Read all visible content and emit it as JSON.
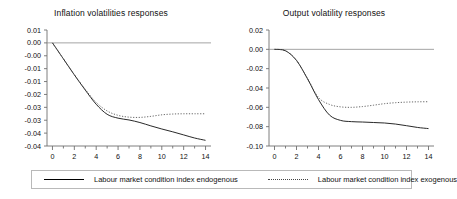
{
  "legend": {
    "entries": [
      {
        "label": "Labour market condition index endogenous",
        "style": "solid",
        "color": "#000000"
      },
      {
        "label": "Labour market condition index exogenous",
        "style": "dotted",
        "color": "#444444"
      }
    ]
  },
  "chart_data": [
    {
      "type": "line",
      "title": "Inflation volatilities responses",
      "xlabel": "",
      "ylabel": "",
      "xlim": [
        -0.5,
        14.5
      ],
      "ylim": [
        -0.04,
        0.005
      ],
      "grid": false,
      "legend_position": "bottom",
      "xticks": [
        0,
        2,
        4,
        6,
        8,
        10,
        12,
        14
      ],
      "xtick_labels": [
        "0",
        "2",
        "4",
        "6",
        "8",
        "10",
        "12",
        "14"
      ],
      "yticks": [
        0.005,
        0.0,
        -0.005,
        -0.01,
        -0.015,
        -0.02,
        -0.025,
        -0.03,
        -0.035,
        -0.04
      ],
      "ytick_labels": [
        "0.01",
        "0.00",
        "-0.00",
        "-0.01",
        "-0.01",
        "-0.02",
        "-0.03",
        "-0.03",
        "-0.04",
        "-0.04"
      ],
      "x": [
        0,
        1,
        2,
        3,
        4,
        5,
        6,
        7,
        8,
        9,
        10,
        11,
        12,
        13,
        14
      ],
      "series": [
        {
          "name": "Labour market condition index endogenous",
          "style": "solid",
          "values": [
            0.0,
            -0.0062,
            -0.0124,
            -0.0183,
            -0.0238,
            -0.0277,
            -0.0292,
            -0.0299,
            -0.0309,
            -0.0322,
            -0.0334,
            -0.0345,
            -0.0357,
            -0.0369,
            -0.0378
          ]
        },
        {
          "name": "Labour market condition index exogenous",
          "style": "dotted",
          "values": [
            0.0,
            -0.0062,
            -0.0123,
            -0.018,
            -0.0231,
            -0.0264,
            -0.0281,
            -0.0288,
            -0.0289,
            -0.0285,
            -0.0279,
            -0.0276,
            -0.0275,
            -0.0275,
            -0.0275
          ]
        }
      ]
    },
    {
      "type": "line",
      "title": "Output volatility responses",
      "xlabel": "",
      "ylabel": "",
      "xlim": [
        -0.5,
        14.5
      ],
      "ylim": [
        -0.1,
        0.02
      ],
      "grid": false,
      "legend_position": "bottom",
      "xticks": [
        0,
        2,
        4,
        6,
        8,
        10,
        12,
        14
      ],
      "xtick_labels": [
        "0",
        "2",
        "4",
        "6",
        "8",
        "10",
        "12",
        "14"
      ],
      "yticks": [
        0.02,
        0.0,
        -0.02,
        -0.04,
        -0.06,
        -0.08,
        -0.1
      ],
      "ytick_labels": [
        "0.02",
        "0.00",
        "-0.02",
        "-0.04",
        "-0.06",
        "-0.08",
        "-0.10"
      ],
      "x": [
        0,
        1,
        2,
        3,
        4,
        5,
        6,
        7,
        8,
        9,
        10,
        11,
        12,
        13,
        14
      ],
      "series": [
        {
          "name": "Labour market condition index endogenous",
          "style": "solid",
          "values": [
            0.0,
            -0.0015,
            -0.0115,
            -0.0305,
            -0.052,
            -0.068,
            -0.0735,
            -0.0748,
            -0.0752,
            -0.0757,
            -0.0762,
            -0.0773,
            -0.079,
            -0.0808,
            -0.082
          ]
        },
        {
          "name": "Labour market condition index exogenous",
          "style": "dotted",
          "values": [
            0.0,
            -0.0015,
            -0.0113,
            -0.03,
            -0.0498,
            -0.057,
            -0.0595,
            -0.06,
            -0.0592,
            -0.0578,
            -0.0562,
            -0.0552,
            -0.0546,
            -0.0543,
            -0.0542
          ]
        }
      ]
    }
  ]
}
